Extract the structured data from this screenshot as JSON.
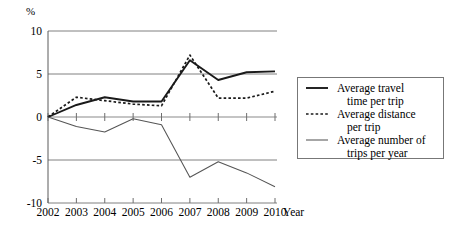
{
  "chart_data": {
    "type": "line",
    "title": "",
    "subtitle": "",
    "xlabel": "Year",
    "ylabel": "%",
    "categories": [
      "2002",
      "2003",
      "2004",
      "2005",
      "2006",
      "2007",
      "2008",
      "2009",
      "2010"
    ],
    "x": [
      2002,
      2003,
      2004,
      2005,
      2006,
      2007,
      2008,
      2009,
      2010
    ],
    "xlim": [
      2002,
      2010
    ],
    "ylim": [
      -10,
      10
    ],
    "yticks": [
      10,
      5,
      0,
      -5,
      -10
    ],
    "ytick_labels": [
      "10",
      "5",
      "0",
      "-5",
      "-10"
    ],
    "grid": true,
    "grid_axis": "y",
    "legend_position": "right",
    "series": [
      {
        "name": "Average travel time per trip",
        "style": "solid-thick",
        "values": [
          0.0,
          1.4,
          2.3,
          1.8,
          1.8,
          6.6,
          4.3,
          5.2,
          5.3
        ]
      },
      {
        "name": "Average distance per trip",
        "style": "dotted",
        "values": [
          0.0,
          2.3,
          1.9,
          1.5,
          1.3,
          7.2,
          2.2,
          2.2,
          3.0
        ]
      },
      {
        "name": "Average number of trips per year",
        "style": "solid-thin",
        "values": [
          0.0,
          -1.1,
          -1.75,
          -0.2,
          -0.9,
          -7.0,
          -5.2,
          -6.5,
          -8.1
        ]
      }
    ]
  },
  "axes": {
    "y_unit_label": "%",
    "x_axis_name": "Year",
    "y_tick_labels": [
      "10",
      "5",
      "0",
      "-5",
      "-10"
    ],
    "x_tick_labels": [
      "2002",
      "2003",
      "2004",
      "2005",
      "2006",
      "2007",
      "2008",
      "2009",
      "2010"
    ]
  },
  "legend": {
    "entries": [
      {
        "line1": "Average travel",
        "line2": "time per trip",
        "marker": "solid-thick-line-icon"
      },
      {
        "line1": "Average distance",
        "line2": "per trip",
        "marker": "dotted-line-icon"
      },
      {
        "line1": "Average number of",
        "line2": "trips per year",
        "marker": "solid-thin-line-icon"
      }
    ]
  },
  "colors": {
    "series_primary": "#1a1a1a",
    "series_tertiary": "#555555",
    "gridline": "#808080",
    "background": "#ffffff"
  }
}
